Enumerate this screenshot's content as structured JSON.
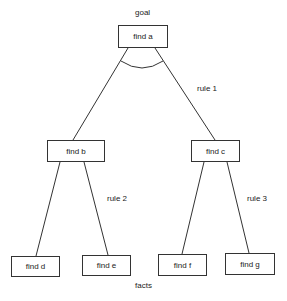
{
  "diagram": {
    "type": "and-or goal tree",
    "labels": {
      "goal": "goal",
      "facts": "facts"
    },
    "nodes": {
      "a": "find a",
      "b": "find b",
      "c": "find c",
      "d": "find d",
      "e": "find e",
      "f": "find f",
      "g": "find g"
    },
    "rules": {
      "rule1": "rule 1",
      "rule2": "rule 2",
      "rule3": "rule 3"
    },
    "edges": [
      {
        "from": "find a",
        "to": "find b",
        "rule": "rule 1"
      },
      {
        "from": "find a",
        "to": "find c",
        "rule": "rule 1"
      },
      {
        "from": "find b",
        "to": "find d",
        "rule": "rule 2"
      },
      {
        "from": "find b",
        "to": "find e",
        "rule": "rule 2"
      },
      {
        "from": "find c",
        "to": "find f",
        "rule": "rule 3"
      },
      {
        "from": "find c",
        "to": "find g",
        "rule": "rule 3"
      }
    ],
    "and_arc": "arc joining edges from find a (AND)",
    "colors": {
      "line": "#333333",
      "background": "#ffffff",
      "text": "#222222"
    }
  }
}
